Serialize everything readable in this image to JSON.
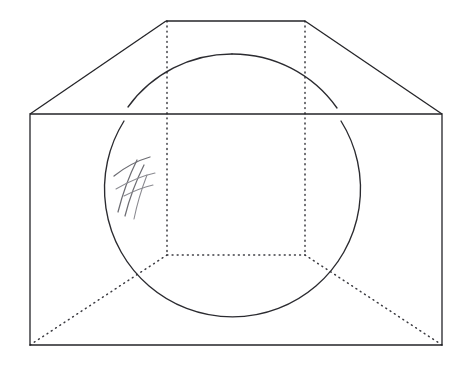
{
  "figure": {
    "canvas": {
      "width": 469,
      "height": 367,
      "background": "#ffffff"
    },
    "colors": {
      "solid_edge": "#242428",
      "hidden_edge": "#3a3a40",
      "sphere_outline": "#2b2b30",
      "pencil_mark": "#6d6d73",
      "pencil_mark_light": "#8a8a90"
    },
    "style": {
      "solid_edge_width": "1.3",
      "hidden_edge_width": "1.5",
      "hidden_edge_dash": "0.9 4.2",
      "sphere_outline_width": "1.35"
    },
    "solid_edges": {
      "front_face_label": "front rectangular face",
      "front_face_path": "M 30 114 L 442 114 L 442 345 L 30 345 Z",
      "ridge_top_label": "top ridge edge",
      "ridge_top_path": "M 166 21 L 305 21",
      "slope_left_label": "left sloping roof edge",
      "slope_left_path": "M 30 114 L 166 21",
      "slope_right_label": "right sloping roof edge",
      "slope_right_path": "M 305 21 L 442 114"
    },
    "hidden_edges": {
      "vertical_left_label": "left hidden vertical edge",
      "vertical_left_path": "M 167 21 L 167 255",
      "vertical_right_label": "right hidden vertical edge",
      "vertical_right_path": "M 305 21 L 305 255",
      "horizontal_label": "hidden back base edge",
      "horizontal_path": "M 167 255 L 305 255",
      "diagonal_left_label": "left hidden base diagonal",
      "diagonal_left_path": "M 30 345 L 167 255",
      "diagonal_right_label": "right hidden base diagonal",
      "diagonal_right_path": "M 442 345 L 305 255"
    },
    "sphere": {
      "label": "inscribed sphere great-circle outline",
      "center_x": 232,
      "center_y": 182,
      "radius": 128,
      "arc_upper_left_path": "M 128 107 A 128 128 0 0 1 232 54",
      "arc_upper_right_path": "M 232 54 A 128 128 0 0 1 337 108",
      "arc_lower_path": "M 341 121 A 128 128 0 1 1 124 121"
    },
    "pencil_marks": {
      "label": "hand-drawn pencil hatch marks",
      "strokes": [
        "M 118 212 C 122 196 129 176 137 160",
        "M 125 216 C 129 200 136 181 144 165",
        "M 134 219 C 137 204 142 188 147 175",
        "M 114 176 C 124 168 136 161 150 157",
        "M 116 189 C 128 182 141 176 155 173",
        "M 124 196 C 134 191 144 187 153 185"
      ]
    }
  }
}
